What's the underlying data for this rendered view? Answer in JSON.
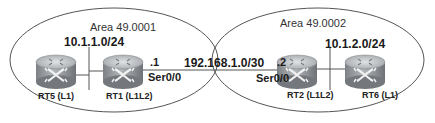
{
  "diagram": {
    "type": "network-topology",
    "areas": [
      {
        "id": "area1",
        "label": "Area 49.0001"
      },
      {
        "id": "area2",
        "label": "Area 49.0002"
      }
    ],
    "routers": [
      {
        "id": "rt5",
        "label": "RT5 (L1)",
        "area": "area1",
        "icon": "router-icon"
      },
      {
        "id": "rt1",
        "label": "RT1 (L1L2)",
        "area": "area1",
        "icon": "router-icon"
      },
      {
        "id": "rt2",
        "label": "RT2 (L1L2)",
        "area": "area2",
        "icon": "router-icon"
      },
      {
        "id": "rt6",
        "label": "RT6 (L1)",
        "area": "area2",
        "icon": "router-icon"
      }
    ],
    "networks": [
      {
        "id": "lan1",
        "label": "10.1.1.0/24",
        "connects": [
          "rt5",
          "rt1"
        ]
      },
      {
        "id": "lan2",
        "label": "10.1.2.0/24",
        "connects": [
          "rt2",
          "rt6"
        ]
      },
      {
        "id": "wan",
        "label": "192.168.1.0/30",
        "connects": [
          "rt1",
          "rt2"
        ]
      }
    ],
    "interfaces": [
      {
        "router": "rt1",
        "name": "Ser0/0",
        "host": ".1"
      },
      {
        "router": "rt2",
        "name": "Ser0/0",
        "host": ".2"
      }
    ],
    "colors": {
      "line": "#555555",
      "router_top": "#b9bcbf",
      "router_body": "#8f9397"
    }
  }
}
